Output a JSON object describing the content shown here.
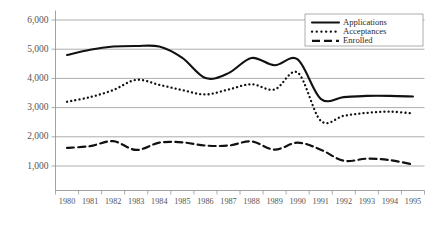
{
  "chart_data": {
    "type": "line",
    "title": "",
    "subtitle": "",
    "xlabel": "",
    "ylabel": "",
    "categories": [
      "1980",
      "1981",
      "1982",
      "1983",
      "1984",
      "1985",
      "1986",
      "1987",
      "1988",
      "1989",
      "1990",
      "1991",
      "1992",
      "1993",
      "1994",
      "1995"
    ],
    "x_tick_labels": [
      "1980",
      "1981",
      "1982",
      "1983",
      "1984",
      "1985",
      "1986",
      "1987",
      "1988",
      "1989",
      "1990",
      "1991",
      "1992",
      "1993",
      "1994",
      "1995"
    ],
    "y_tick_labels": [
      "6,000",
      "5,000",
      "4,000",
      "3,000",
      "2,000",
      "1,000"
    ],
    "y_tick_values": [
      6000,
      5000,
      4000,
      3000,
      2000,
      1000
    ],
    "ylim": [
      700,
      6000
    ],
    "xlim": [
      "1980",
      "1995"
    ],
    "grid": "horizontal",
    "legend_position": "top-right",
    "series": [
      {
        "name": "Applications",
        "style": "solid",
        "color": "#111111",
        "values": [
          4800,
          4980,
          5090,
          5110,
          5090,
          4700,
          4010,
          4180,
          4700,
          4450,
          4650,
          3300,
          3360,
          3400,
          3400,
          3380
        ]
      },
      {
        "name": "Acceptances",
        "style": "dotted",
        "color": "#111111",
        "values": [
          3200,
          3360,
          3600,
          3950,
          3780,
          3600,
          3450,
          3620,
          3800,
          3620,
          4200,
          2550,
          2720,
          2820,
          2860,
          2800
        ]
      },
      {
        "name": "Enrolled",
        "style": "dashed",
        "color": "#111111",
        "values": [
          1620,
          1680,
          1850,
          1550,
          1800,
          1810,
          1700,
          1700,
          1840,
          1560,
          1800,
          1560,
          1180,
          1250,
          1200,
          1050
        ]
      }
    ]
  },
  "legend": {
    "items": [
      {
        "label": "Applications",
        "style": "solid"
      },
      {
        "label": "Acceptances",
        "style": "dotted"
      },
      {
        "label": "Enrolled",
        "style": "dashed"
      }
    ]
  }
}
